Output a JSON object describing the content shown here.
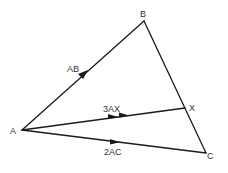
{
  "diagram": {
    "points": {
      "A": {
        "label": "A",
        "x": 22,
        "y": 130
      },
      "B": {
        "label": "B",
        "x": 144,
        "y": 21
      },
      "X": {
        "label": "X",
        "x": 185,
        "y": 108
      },
      "C": {
        "label": "C",
        "x": 206,
        "y": 153
      }
    },
    "vectors": {
      "AB": {
        "label": "AB",
        "arrowheads": 1
      },
      "AX": {
        "label": "3AX",
        "arrowheads": 2
      },
      "AC": {
        "label": "2AC",
        "arrowheads": 1
      }
    },
    "segments": [
      "AB",
      "BC",
      "AX",
      "AC"
    ],
    "colors": {
      "line": "#1a1a1a",
      "text": "#333333",
      "background": "#ffffff"
    }
  }
}
